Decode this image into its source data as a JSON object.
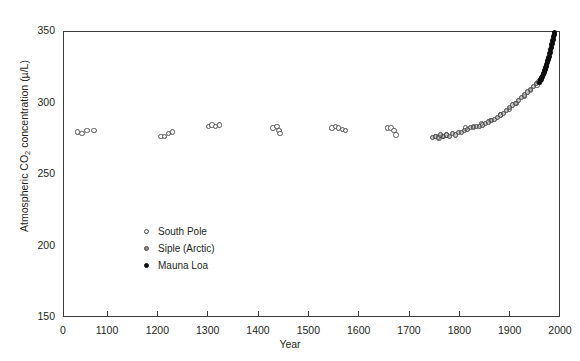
{
  "chart_data": {
    "type": "scatter",
    "title": "",
    "xlabel": "Year",
    "ylabel": "Atmospheric CO2 concentration (µ/L)",
    "ylabel_parts": {
      "pre": "Atmospheric CO",
      "sub": "2",
      "post": " concentration (µ/L)"
    },
    "xlim": [
      1000,
      2000
    ],
    "ylim": [
      150,
      350
    ],
    "x_axis_break": true,
    "xticks": [
      0,
      1100,
      1200,
      1300,
      1400,
      1500,
      1600,
      1700,
      1800,
      1900,
      2000
    ],
    "xticklabels": [
      "0",
      "1100",
      "1200",
      "1300",
      "1400",
      "1500",
      "1600",
      "1700",
      "1800",
      "1900",
      "2000"
    ],
    "yticks": [
      150,
      200,
      250,
      300,
      350
    ],
    "yticklabels": [
      "150",
      "200",
      "250",
      "300",
      "350"
    ],
    "grid": false,
    "legend_position": "center-left-lower",
    "series": [
      {
        "name": "South Pole",
        "marker": "open-circle",
        "color": "#555555",
        "points": [
          [
            1040,
            280
          ],
          [
            1048,
            279
          ],
          [
            1058,
            281
          ],
          [
            1072,
            281
          ],
          [
            1205,
            277
          ],
          [
            1212,
            277
          ],
          [
            1220,
            279
          ],
          [
            1228,
            280
          ],
          [
            1300,
            284
          ],
          [
            1307,
            285
          ],
          [
            1314,
            284
          ],
          [
            1321,
            285
          ],
          [
            1428,
            283
          ],
          [
            1436,
            284
          ],
          [
            1440,
            281
          ],
          [
            1442,
            279
          ],
          [
            1545,
            283
          ],
          [
            1552,
            284
          ],
          [
            1558,
            283
          ],
          [
            1566,
            282
          ],
          [
            1572,
            281
          ],
          [
            1655,
            283
          ],
          [
            1662,
            283
          ],
          [
            1668,
            281
          ],
          [
            1672,
            278
          ],
          [
            1752,
            277
          ],
          [
            1758,
            276
          ],
          [
            1765,
            277
          ],
          [
            1772,
            278
          ],
          [
            1810,
            283
          ],
          [
            1826,
            284
          ],
          [
            1842,
            286
          ],
          [
            1860,
            288
          ],
          [
            1880,
            292
          ],
          [
            1898,
            296
          ],
          [
            1912,
            300
          ],
          [
            1928,
            305
          ],
          [
            1940,
            309
          ],
          [
            1952,
            313
          ]
        ]
      },
      {
        "name": "Siple (Arctic)",
        "marker": "gray-circle",
        "color": "#8d8d8d",
        "points": [
          [
            1745,
            276
          ],
          [
            1750,
            277
          ],
          [
            1756,
            276
          ],
          [
            1760,
            278
          ],
          [
            1766,
            277
          ],
          [
            1772,
            278
          ],
          [
            1778,
            277
          ],
          [
            1784,
            279
          ],
          [
            1790,
            278
          ],
          [
            1796,
            280
          ],
          [
            1802,
            280
          ],
          [
            1808,
            281
          ],
          [
            1814,
            282
          ],
          [
            1820,
            283
          ],
          [
            1826,
            283
          ],
          [
            1832,
            284
          ],
          [
            1838,
            284
          ],
          [
            1844,
            285
          ],
          [
            1850,
            286
          ],
          [
            1856,
            287
          ],
          [
            1862,
            288
          ],
          [
            1868,
            289
          ],
          [
            1874,
            290
          ],
          [
            1880,
            292
          ],
          [
            1886,
            293
          ],
          [
            1892,
            295
          ],
          [
            1898,
            297
          ],
          [
            1904,
            299
          ],
          [
            1910,
            300
          ],
          [
            1916,
            302
          ],
          [
            1922,
            304
          ],
          [
            1928,
            306
          ],
          [
            1934,
            308
          ],
          [
            1940,
            310
          ],
          [
            1946,
            312
          ],
          [
            1952,
            314
          ],
          [
            1956,
            315
          ]
        ]
      },
      {
        "name": "Mauna Loa",
        "marker": "filled-circle",
        "color": "#0d0d0d",
        "points": [
          [
            1958,
            315
          ],
          [
            1959,
            316
          ],
          [
            1960,
            317
          ],
          [
            1961,
            317
          ],
          [
            1962,
            318
          ],
          [
            1963,
            319
          ],
          [
            1964,
            319
          ],
          [
            1965,
            320
          ],
          [
            1966,
            321
          ],
          [
            1967,
            322
          ],
          [
            1968,
            323
          ],
          [
            1969,
            324
          ],
          [
            1970,
            325
          ],
          [
            1971,
            326
          ],
          [
            1972,
            327
          ],
          [
            1973,
            329
          ],
          [
            1974,
            330
          ],
          [
            1975,
            331
          ],
          [
            1976,
            332
          ],
          [
            1977,
            333
          ],
          [
            1978,
            335
          ],
          [
            1979,
            336
          ],
          [
            1980,
            338
          ],
          [
            1981,
            339
          ],
          [
            1982,
            341
          ],
          [
            1983,
            342
          ],
          [
            1984,
            344
          ],
          [
            1985,
            345
          ],
          [
            1986,
            347
          ],
          [
            1987,
            348
          ],
          [
            1988,
            350
          ]
        ]
      }
    ]
  },
  "legend": {
    "items": [
      {
        "label": "South Pole",
        "marker": "open-circle"
      },
      {
        "label": "Siple (Arctic)",
        "marker": "gray-circle"
      },
      {
        "label": "Mauna Loa",
        "marker": "filled-circle"
      }
    ]
  },
  "caption": {
    "text": ""
  }
}
